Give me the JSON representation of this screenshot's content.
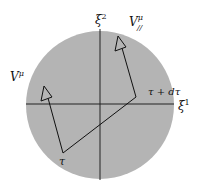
{
  "diagram": {
    "colors": {
      "disk": "#b4b4b4",
      "line": "#111111",
      "background": "#ffffff"
    },
    "labels": {
      "xi2": "ξ",
      "xi2_sup": "2",
      "xi1": "ξ",
      "xi1_sup": "1",
      "V": "V",
      "V_sup": "μ",
      "Vpar": "V",
      "Vpar_sup": "μ",
      "Vpar_sub": "//",
      "tau": "τ",
      "tau_dtau": "τ + dτ"
    }
  }
}
